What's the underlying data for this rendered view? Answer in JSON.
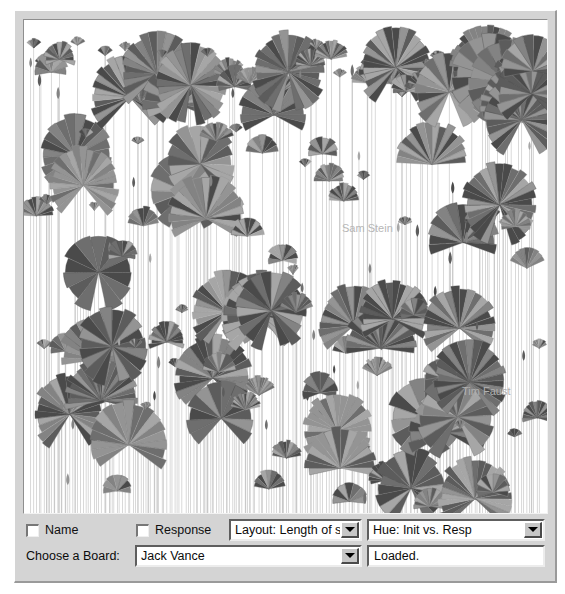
{
  "window": {
    "title": "Loom Visualization"
  },
  "canvas": {
    "name": "thread-garden-canvas",
    "background": "#ffffff",
    "stem_color": "#c9c9c9",
    "blossom_dark": "#4a4a4a",
    "blossom_mid": "#6e6e6e",
    "blossom_light": "#a6a6a6",
    "labels": [
      {
        "text": "Sam Stein",
        "x": 318,
        "y": 212,
        "color": "#b6b6b6"
      },
      {
        "text": "Tim Faust",
        "x": 438,
        "y": 375,
        "color": "#b0b0b0"
      }
    ]
  },
  "controls": {
    "name_checkbox": {
      "label": "Name",
      "checked": false
    },
    "response_checkbox": {
      "label": "Response",
      "checked": false
    },
    "layout_select": {
      "value": "Layout: Length of stay",
      "options": [
        "Layout: Length of stay",
        "Layout: Number of posts",
        "Layout: Alphabetical",
        "Layout: Date of first post"
      ]
    },
    "hue_select": {
      "value": "Hue: Init vs. Resp",
      "options": [
        "Hue: Init vs. Resp",
        "Hue: Length of stay",
        "Hue: Number of posts",
        "Hue: Response rate"
      ]
    },
    "board_label": "Choose a Board:",
    "board_select": {
      "value": "Jack Vance",
      "options": [
        "Jack Vance",
        "Gene Wolfe",
        "Ursula K. Le Guin",
        "Philip K. Dick"
      ]
    },
    "status_field": {
      "value": "Loaded."
    }
  },
  "chart_data": {
    "type": "scatter",
    "title": "",
    "xlabel": "",
    "ylabel": "",
    "seed": 20247,
    "stem_count": 196,
    "xlim": [
      0,
      523
    ],
    "ylim": [
      0,
      493
    ],
    "grid": false,
    "legend": "none"
  }
}
